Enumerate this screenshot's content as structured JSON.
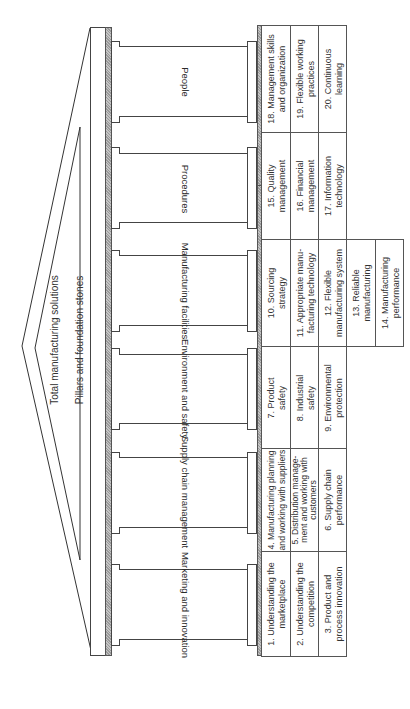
{
  "diagram": {
    "title": "Total manufacturing solutions",
    "subtitle": "Pillars and foundation stones",
    "orientation": "rotated 90 degrees clockwise",
    "pillars": [
      {
        "label": "People",
        "stones": [
          "18. Management skills\nand organization",
          "19. Flexible working\npractices",
          "20. Continuous\nlearning"
        ]
      },
      {
        "label": "Procedures",
        "stones": [
          "15. Quality\nmanagement",
          "16. Financial\nmanagement",
          "17. Information\ntechnology"
        ]
      },
      {
        "label": "Manufacturing facilities",
        "stones": [
          "10. Sourcing\nstrategy",
          "11. Appropriate manu-\nfacturing technology",
          "12. Flexible\nmanufacturing system",
          "13. Reliable\nmanufacturing",
          "14. Manufacturing\nperformance"
        ]
      },
      {
        "label": "Environment and safety",
        "stones": [
          "7. Product\nsafety",
          "8. Industrial\nsafety",
          "9. Environmental\nprotection"
        ]
      },
      {
        "label": "Supply chain management",
        "stones": [
          "4. Manufacturing planning\nand working with suppliers",
          "5. Distribution manage-\nment and working with\ncustomers",
          "6. Supply chain\nperformance"
        ]
      },
      {
        "label": "Marketing and innovation",
        "stones": [
          "1. Understanding the\nmarketplace",
          "2. Understanding the\ncompetition",
          "3. Product and\nprocess innovation"
        ]
      }
    ]
  }
}
